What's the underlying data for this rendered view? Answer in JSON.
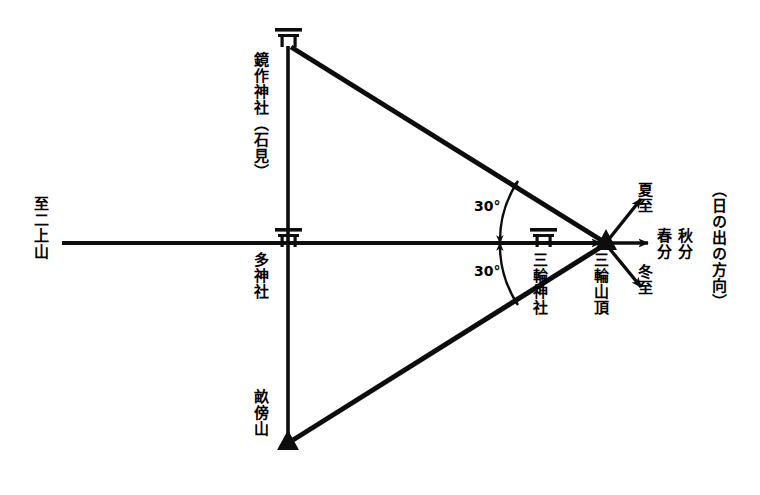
{
  "diagram": {
    "description_domain": "japanese-shrine-solar-alignment-diagram",
    "nodes": [
      {
        "id": "kagamitsukuri",
        "label": "鏡作神社（石見）",
        "marker": "torii-icon",
        "x": 288,
        "y": 43
      },
      {
        "id": "oo-jinja",
        "label": "多神社",
        "marker": "torii-icon",
        "x": 288,
        "y": 243
      },
      {
        "id": "unebiyama",
        "label": "畝傍山",
        "marker": "mountain-triangle-icon",
        "x": 288,
        "y": 443
      },
      {
        "id": "miwa-jinja",
        "label": "三輪神社",
        "marker": "torii-icon",
        "x": 543,
        "y": 243
      },
      {
        "id": "miwa-santyou",
        "label": "三輪山頂",
        "marker": "mountain-triangle-icon",
        "x": 606,
        "y": 243
      }
    ],
    "edge_label_left": "至二上山",
    "angles": [
      {
        "id": "angle-upper",
        "value": "30°",
        "x": 478,
        "y": 205
      },
      {
        "id": "angle-lower",
        "value": "30°",
        "x": 478,
        "y": 270
      }
    ],
    "solar_directions": [
      {
        "id": "geshi",
        "label": "夏至",
        "meaning": "summer-solstice"
      },
      {
        "id": "shunbun",
        "label": "春分",
        "meaning": "vernal-equinox"
      },
      {
        "id": "shuubun",
        "label": "秋分",
        "meaning": "autumnal-equinox"
      },
      {
        "id": "touji",
        "label": "冬至",
        "meaning": "winter-solstice"
      }
    ],
    "sunrise_caption": "（日の出の方向）",
    "colors": {
      "ink": "#0d0d0d",
      "background": "#ffffff"
    }
  }
}
